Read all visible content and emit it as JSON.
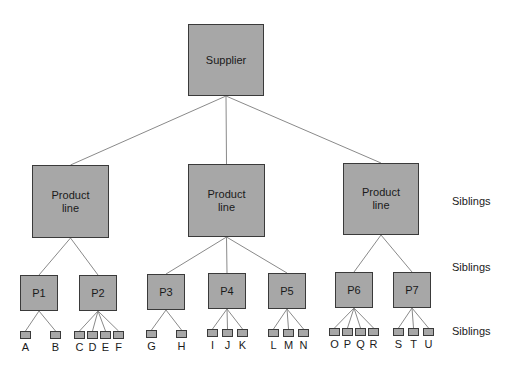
{
  "diagram": {
    "root": {
      "label": "Supplier",
      "x": 188,
      "y": 24,
      "w": 76,
      "h": 72
    },
    "product_lines": [
      {
        "label": "Product\nline",
        "x": 32,
        "y": 165,
        "w": 77,
        "h": 73
      },
      {
        "label": "Product\nline",
        "x": 188,
        "y": 164,
        "w": 77,
        "h": 73
      },
      {
        "label": "Product\nline",
        "x": 343,
        "y": 163,
        "w": 76,
        "h": 72
      }
    ],
    "products": [
      {
        "label": "P1",
        "parent": 0,
        "x": 20,
        "y": 275,
        "w": 38,
        "h": 36,
        "children": [
          "A",
          "B"
        ]
      },
      {
        "label": "P2",
        "parent": 0,
        "x": 79,
        "y": 275,
        "w": 38,
        "h": 36,
        "children": [
          "C",
          "D",
          "E",
          "F"
        ]
      },
      {
        "label": "P3",
        "parent": 1,
        "x": 147,
        "y": 274,
        "w": 38,
        "h": 36,
        "children": [
          "G",
          "H"
        ]
      },
      {
        "label": "P4",
        "parent": 1,
        "x": 208,
        "y": 273,
        "w": 38,
        "h": 36,
        "children": [
          "I",
          "J",
          "K"
        ]
      },
      {
        "label": "P5",
        "parent": 1,
        "x": 268,
        "y": 273,
        "w": 38,
        "h": 36,
        "children": [
          "L",
          "M",
          "N"
        ]
      },
      {
        "label": "P6",
        "parent": 2,
        "x": 335,
        "y": 272,
        "w": 38,
        "h": 36,
        "children": [
          "O",
          "P",
          "Q",
          "R"
        ]
      },
      {
        "label": "P7",
        "parent": 2,
        "x": 393,
        "y": 272,
        "w": 38,
        "h": 36,
        "children": [
          "S",
          "T",
          "U"
        ]
      }
    ],
    "leaves": [
      {
        "label": "A",
        "x": 20,
        "y": 331
      },
      {
        "label": "B",
        "x": 50,
        "y": 331
      },
      {
        "label": "C",
        "x": 74,
        "y": 331
      },
      {
        "label": "D",
        "x": 87,
        "y": 331
      },
      {
        "label": "E",
        "x": 100,
        "y": 331
      },
      {
        "label": "F",
        "x": 113,
        "y": 331
      },
      {
        "label": "G",
        "x": 146,
        "y": 330
      },
      {
        "label": "H",
        "x": 176,
        "y": 330
      },
      {
        "label": "I",
        "x": 207,
        "y": 329
      },
      {
        "label": "J",
        "x": 222,
        "y": 329
      },
      {
        "label": "K",
        "x": 237,
        "y": 329
      },
      {
        "label": "L",
        "x": 268,
        "y": 329
      },
      {
        "label": "M",
        "x": 283,
        "y": 329
      },
      {
        "label": "N",
        "x": 298,
        "y": 329
      },
      {
        "label": "O",
        "x": 329,
        "y": 328
      },
      {
        "label": "P",
        "x": 342,
        "y": 328
      },
      {
        "label": "Q",
        "x": 355,
        "y": 328
      },
      {
        "label": "R",
        "x": 368,
        "y": 328
      },
      {
        "label": "S",
        "x": 393,
        "y": 328
      },
      {
        "label": "T",
        "x": 408,
        "y": 328
      },
      {
        "label": "U",
        "x": 423,
        "y": 328
      }
    ],
    "side_labels": [
      {
        "label": "Siblings",
        "x": 452,
        "y": 195
      },
      {
        "label": "Siblings",
        "x": 452,
        "y": 261
      },
      {
        "label": "Siblings",
        "x": 452,
        "y": 325
      }
    ],
    "colors": {
      "box_fill": "#a7a7a7",
      "box_border": "#3a3a3a",
      "line": "#8a8a8a"
    }
  }
}
